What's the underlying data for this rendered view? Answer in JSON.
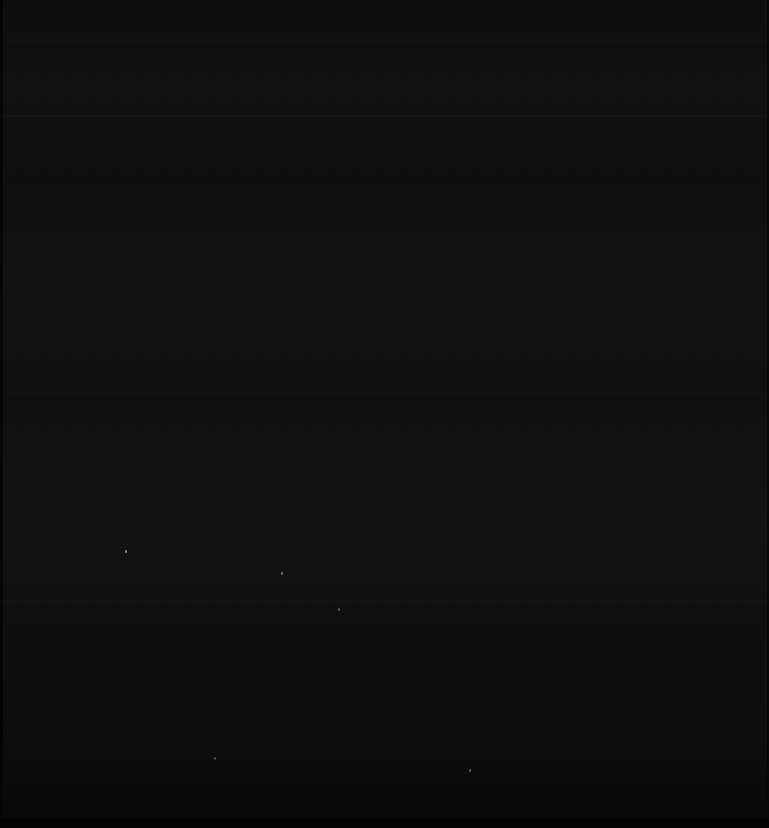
{
  "screen": {
    "width_px": 769,
    "height_px": 828,
    "state": "blank-dark",
    "visible_text": "",
    "background_color": "#0b0b0b",
    "darkest_color": "#050505",
    "brightest_color": "#141414",
    "has_readable_content": false,
    "description": "Uniformly black screen capture with no discernible text, icons, or UI widgets"
  },
  "edges": {
    "left_strip_color": "#040404",
    "right_strip_color": "#060606",
    "bottom_strip_color": "#040404"
  },
  "bands": [
    {
      "name": "band-top",
      "y": 40,
      "height": 3,
      "color": "#121212",
      "opacity": 0.55
    },
    {
      "name": "band-upper-divider",
      "y": 115,
      "height": 2,
      "color": "#151515",
      "opacity": 0.6
    },
    {
      "name": "band-upper-mid",
      "y": 190,
      "height": 3,
      "color": "#111111",
      "opacity": 0.45
    },
    {
      "name": "band-mid-upper",
      "y": 260,
      "height": 3,
      "color": "#101010",
      "opacity": 0.45
    },
    {
      "name": "band-center",
      "y": 392,
      "height": 4,
      "color": "#121212",
      "opacity": 0.4
    },
    {
      "name": "band-lower-divider",
      "y": 600,
      "height": 3,
      "color": "#141414",
      "opacity": 0.55
    },
    {
      "name": "band-lower",
      "y": 690,
      "height": 3,
      "color": "#0f0f0f",
      "opacity": 0.4
    },
    {
      "name": "band-bottom",
      "y": 770,
      "height": 3,
      "color": "#0e0e0e",
      "opacity": 0.35
    }
  ],
  "specks": [
    {
      "name": "noise-speck-1",
      "x": 125,
      "y": 550,
      "color": "#8a8a8a"
    },
    {
      "name": "noise-speck-2",
      "x": 281,
      "y": 572,
      "color": "#6f6f6f"
    },
    {
      "name": "noise-speck-3",
      "x": 469,
      "y": 769,
      "color": "#5c5c5c"
    },
    {
      "name": "noise-speck-4",
      "x": 338,
      "y": 608,
      "color": "#555555"
    },
    {
      "name": "noise-speck-5",
      "x": 214,
      "y": 757,
      "color": "#4e4e4e"
    }
  ]
}
